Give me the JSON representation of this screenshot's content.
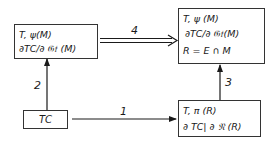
{
  "diagram": {
    "nodes": {
      "box_m": {
        "lines": [
          "T, ψ(M)",
          "∂TC/∂ 𝔊𝔱 (M)"
        ]
      },
      "box_r_m": {
        "lines": [
          "T, ψ (M)",
          "∂TC/∂ 𝔊𝔱(M)",
          "R = E ∩ M"
        ]
      },
      "box_tc": {
        "label": "TC"
      },
      "box_r": {
        "lines": [
          "T, π (R)",
          "∂ TC| ∂ 𝔑 (R)"
        ]
      }
    },
    "edges": [
      {
        "id": "1",
        "label": "1",
        "from": "TC",
        "to": "T, π (R)",
        "style": "single-arrow"
      },
      {
        "id": "2",
        "label": "2",
        "from": "TC",
        "to": "T, ψ(M)",
        "style": "single-arrow"
      },
      {
        "id": "3",
        "label": "3",
        "from": "T, π (R)",
        "to": "T, ψ (M) / R = E ∩ M",
        "style": "single-arrow"
      },
      {
        "id": "4",
        "label": "4",
        "from": "T, ψ(M)",
        "to": "T, ψ (M) / R = E ∩ M",
        "style": "double-arrow"
      }
    ]
  }
}
